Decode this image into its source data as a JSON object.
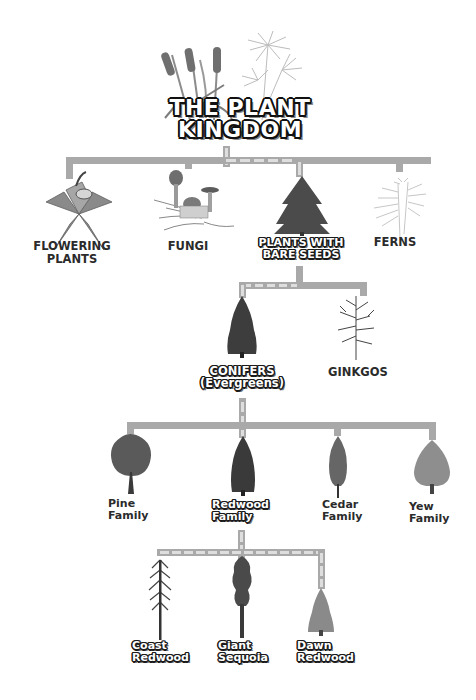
{
  "title": {
    "line1": "THE PLANT",
    "line2": "KINGDOM"
  },
  "colors": {
    "connector": "#a9a9a9",
    "highlight_path": "#dedede",
    "label_text": "#2b2b2b",
    "outline": "#1a1a1a"
  },
  "level1": [
    {
      "id": "flowering",
      "line1": "FLOWERING",
      "line2": "PLANTS",
      "icon": "flower-icon",
      "highlighted": false
    },
    {
      "id": "fungi",
      "line1": "FUNGI",
      "line2": "",
      "icon": "mushroom-icon",
      "highlighted": false
    },
    {
      "id": "bare-seeds",
      "line1": "PLANTS WITH",
      "line2": "BARE SEEDS",
      "icon": "fir-tree-icon",
      "highlighted": true
    },
    {
      "id": "ferns",
      "line1": "FERNS",
      "line2": "",
      "icon": "fern-icon",
      "highlighted": false
    }
  ],
  "level2": [
    {
      "id": "conifers",
      "line1": "CONIFERS",
      "line2": "(Evergreens)",
      "icon": "conifer-icon",
      "highlighted": true
    },
    {
      "id": "ginkgos",
      "line1": "GINKGOS",
      "line2": "",
      "icon": "bare-tree-icon",
      "highlighted": false
    }
  ],
  "level3": [
    {
      "id": "pine",
      "line1": "Pine",
      "line2": "Family",
      "icon": "pine-tree-icon",
      "highlighted": false
    },
    {
      "id": "redwood",
      "line1": "Redwood",
      "line2": "Family",
      "icon": "redwood-tree-icon",
      "highlighted": true
    },
    {
      "id": "cedar",
      "line1": "Cedar",
      "line2": "Family",
      "icon": "cedar-tree-icon",
      "highlighted": false
    },
    {
      "id": "yew",
      "line1": "Yew",
      "line2": "Family",
      "icon": "yew-tree-icon",
      "highlighted": false
    }
  ],
  "level4": [
    {
      "id": "coast",
      "line1": "Coast",
      "line2": "Redwood",
      "icon": "coast-redwood-icon",
      "highlighted": true
    },
    {
      "id": "giant",
      "line1": "Giant",
      "line2": "Sequoia",
      "icon": "giant-sequoia-icon",
      "highlighted": true
    },
    {
      "id": "dawn",
      "line1": "Dawn",
      "line2": "Redwood",
      "icon": "dawn-redwood-icon",
      "highlighted": true
    }
  ]
}
